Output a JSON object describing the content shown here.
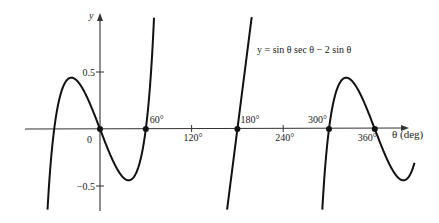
{
  "chart_data": {
    "type": "line",
    "title": "y = sin θ sec θ − 2 sin θ",
    "equation_label": "y = sin θ sec θ − 2 sin θ",
    "xlabel": "θ (deg)",
    "ylabel": "y",
    "origin_label": "0",
    "x_ticks": [
      {
        "value": 60,
        "label": "60°",
        "marked_point": true
      },
      {
        "value": 120,
        "label": "120°",
        "marked_point": false
      },
      {
        "value": 180,
        "label": "180°",
        "marked_point": true
      },
      {
        "value": 240,
        "label": "240°",
        "marked_point": false
      },
      {
        "value": 300,
        "label": "300°",
        "marked_point": true
      },
      {
        "value": 360,
        "label": "360°",
        "marked_point": true
      }
    ],
    "y_ticks": [
      {
        "value": 0.5,
        "label": "0.5"
      },
      {
        "value": -0.5,
        "label": "-0.5"
      }
    ],
    "zeros_marked_deg": [
      0,
      60,
      180,
      300,
      360
    ],
    "series": [
      {
        "name": "y = sin θ sec θ − 2 sin θ",
        "function": "tan(θ) - 2 sin(θ)",
        "branches_deg": [
          [
            -76,
            85.5
          ],
          [
            94.5,
            265.5
          ],
          [
            274.5,
            412
          ]
        ]
      }
    ],
    "xlim": [
      -98,
      400
    ],
    "ylim": [
      -0.72,
      1.0
    ],
    "grid": false,
    "legend": "none"
  },
  "layout": {
    "origin_px": [
      100,
      129
    ],
    "px_per_degree": 0.7633,
    "px_per_unit_y": 114
  }
}
